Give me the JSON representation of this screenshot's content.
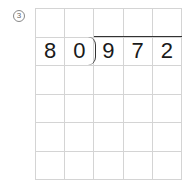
{
  "problem": {
    "number_label": "3",
    "divisor": [
      "8",
      "0"
    ],
    "dividend": [
      "9",
      "7",
      "2"
    ],
    "grid": {
      "columns": 5,
      "rows": 6,
      "cells": [
        [
          "",
          "",
          "",
          "",
          ""
        ],
        [
          "8",
          "0",
          "9",
          "7",
          "2"
        ],
        [
          "",
          "",
          "",
          "",
          ""
        ],
        [
          "",
          "",
          "",
          "",
          ""
        ],
        [
          "",
          "",
          "",
          "",
          ""
        ],
        [
          "",
          "",
          "",
          "",
          ""
        ]
      ]
    }
  }
}
